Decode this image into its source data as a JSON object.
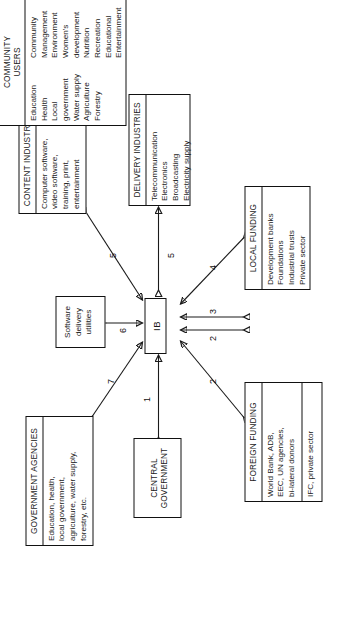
{
  "diagram": {
    "center_node": {
      "label": "IB"
    },
    "boxes": {
      "central_government": {
        "header": "CENTRAL\nGOVERNMENT",
        "body": ""
      },
      "government_agencies": {
        "header": "GOVERNMENT AGENCIES",
        "body": "Education, health,\nlocal government,\nagriculture, water supply,\nforestry, etc."
      },
      "software_delivery": {
        "header": "",
        "body": "Software\ndelivery\nutilities"
      },
      "foreign_funding": {
        "header": "FOREIGN FUNDING",
        "body": "World Bank, ADB,\nEEC, UN agencies,\nbi-lateral donors",
        "body2": "IFC, private sector"
      },
      "local_funding": {
        "header": "LOCAL FUNDING",
        "body": "Development banks\nFoundations\nIndustrial trusts\nPrivate sector"
      },
      "delivery_industries": {
        "header": "DELIVERY INDUSTRIES",
        "body": "Telecommunication\nElectronics\nBroadcasting\nElectricity supply"
      },
      "content_industries": {
        "header": "CONTENT INDUSTRIES",
        "body": "Computer software,\nvideo software,\ntraining, print,\nentertainment"
      },
      "community_users": {
        "header": "COMMUNITY\nUSERS",
        "body": "Education\nHealth\nLocal\ngovernment\nWater supply\nAgriculture\nForestry",
        "body2": "Community\nManagement\nEnvironment\nWomen's\ndevelopment\nNutrition\nRecreation\nEducational\nEntertainment"
      }
    },
    "edge_labels": {
      "e1": "1",
      "e2a": "2",
      "e2b": "2",
      "e3": "3",
      "e4": "4",
      "e5a": "5",
      "e5b": "5",
      "e6": "6",
      "e7": "7"
    }
  }
}
